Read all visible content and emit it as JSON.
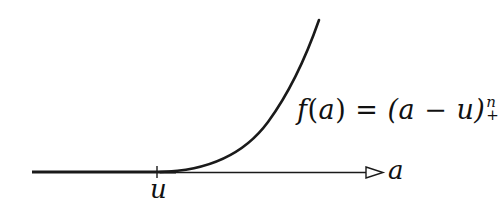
{
  "diagram": {
    "type": "function-plot",
    "formula": {
      "lhs_func": "f",
      "lhs_arg": "a",
      "equals": "=",
      "rhs_base": "(a − u)",
      "superscript": "n",
      "subscript": "+"
    },
    "axis": {
      "label": "a",
      "tick_label": "u"
    },
    "colors": {
      "stroke": "#1a1a1a",
      "background": "#ffffff"
    }
  }
}
